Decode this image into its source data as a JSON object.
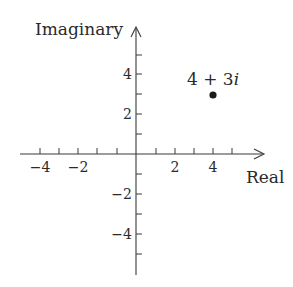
{
  "diagram": {
    "type": "complex-plane",
    "axes": {
      "x_label": "Real",
      "y_label": "Imaginary",
      "x_tick_labels": [
        {
          "value": -4,
          "text": "−4"
        },
        {
          "value": -2,
          "text": "−2"
        },
        {
          "value": 2,
          "text": "2"
        },
        {
          "value": 4,
          "text": "4"
        }
      ],
      "y_tick_labels": [
        {
          "value": 4,
          "text": "4"
        },
        {
          "value": 2,
          "text": "2"
        },
        {
          "value": -2,
          "text": "−2"
        },
        {
          "value": -4,
          "text": "−4"
        }
      ],
      "x_range": [
        -5,
        6
      ],
      "y_range": [
        -6,
        5
      ],
      "tick_step": 1
    },
    "point": {
      "label": "4 + 3",
      "label_italic": "i",
      "real": 4,
      "imaginary": 3,
      "color": "#1a1a1a"
    }
  }
}
